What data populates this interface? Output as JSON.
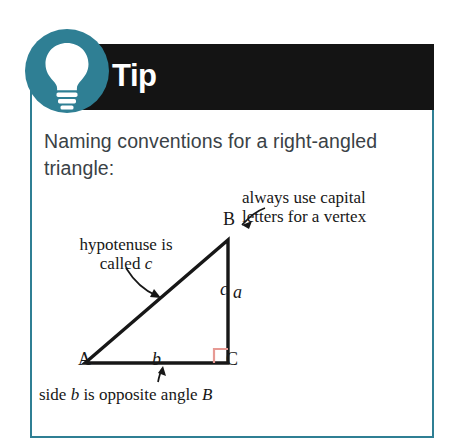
{
  "callout": {
    "kind": "tip-callout",
    "banner_label": "Tip",
    "icon": "lightbulb-icon",
    "heading": "Naming conventions for a right-angled triangle:",
    "colors": {
      "teal": "#2f7f94",
      "banner_black": "#141414",
      "banner_text": "#ffffff",
      "heading_text": "#3a4246",
      "figure_ink": "#171717",
      "right_angle_marker": "#e79a94"
    }
  },
  "figure": {
    "name": "right-angled-triangle-diagram",
    "vertices": [
      {
        "id": "A",
        "label": "A",
        "x": 85,
        "y": 363
      },
      {
        "id": "B",
        "label": "B",
        "x": 228,
        "y": 240
      },
      {
        "id": "C",
        "label": "C",
        "x": 228,
        "y": 363
      }
    ],
    "side_labels": [
      {
        "id": "a",
        "label": "a",
        "side": "BC",
        "style": "italic"
      },
      {
        "id": "b",
        "label": "b",
        "side": "AC",
        "style": "italic"
      },
      {
        "id": "c",
        "label": "c",
        "side": "AB",
        "style": "italic"
      }
    ],
    "right_angle_at": "C",
    "annotations": [
      {
        "id": "vertex-note",
        "line1": "always use capital",
        "line2": "letters for a vertex",
        "points_to": "B"
      },
      {
        "id": "hypotenuse-note",
        "line1": "hypotenuse is",
        "line2_prefix": "called ",
        "line2_italic": "c",
        "points_to": "c"
      },
      {
        "id": "side-b-note",
        "prefix": "side ",
        "italic1": "b",
        "middle": " is opposite angle ",
        "italic2": "B",
        "points_to": "b"
      }
    ]
  }
}
